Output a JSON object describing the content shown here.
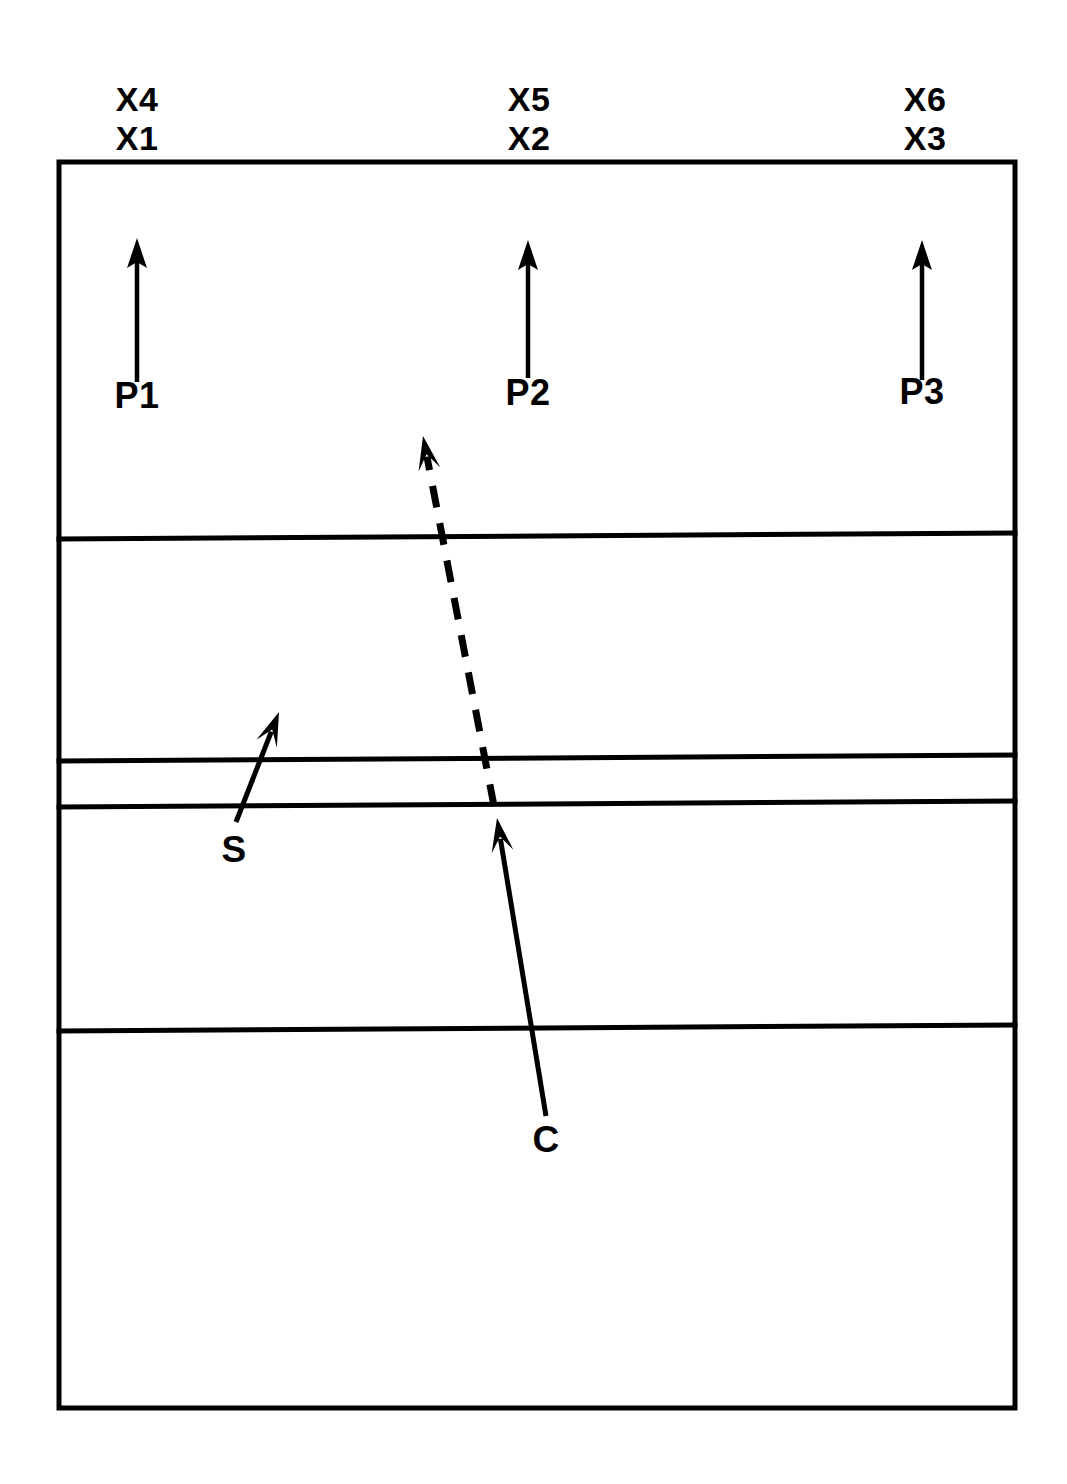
{
  "figure": {
    "type": "geologic-cross-section",
    "background_color": "#ffffff",
    "line_color": "#000000",
    "frame": {
      "left": 59,
      "top": 162,
      "right": 1015,
      "bottom": 1408
    }
  },
  "horizon_labels": [
    {
      "id": "left",
      "top_label": "X4",
      "bottom_label": "X1",
      "x": 137
    },
    {
      "id": "center",
      "top_label": "X5",
      "bottom_label": "X2",
      "x": 529
    },
    {
      "id": "right",
      "top_label": "X6",
      "bottom_label": "X3",
      "x": 925
    }
  ],
  "marker_arrows": [
    {
      "label": "P1",
      "x": 137,
      "tip_y": 238,
      "tail_y": 382,
      "label_y": 408
    },
    {
      "label": "P2",
      "x": 528,
      "tip_y": 240,
      "tail_y": 378,
      "label_y": 405
    },
    {
      "label": "P3",
      "x": 922,
      "tip_y": 240,
      "tail_y": 380,
      "label_y": 404
    }
  ],
  "feature_arrows": [
    {
      "label": "S",
      "style": "solid",
      "tail_x": 236,
      "tail_y": 822,
      "tip_x": 279,
      "tip_y": 712,
      "label_x": 234,
      "label_y": 862
    },
    {
      "label": "C",
      "style": "solid",
      "tail_x": 546,
      "tail_y": 1116,
      "tip_x": 497,
      "tip_y": 818,
      "label_x": 546,
      "label_y": 1152
    },
    {
      "label": "",
      "style": "dashed",
      "tail_x": 494,
      "tail_y": 806,
      "tip_x": 423,
      "tip_y": 436,
      "label_x": 0,
      "label_y": 0
    }
  ],
  "strata_lines": [
    {
      "id": "horizon-1",
      "left_y": 539,
      "right_y": 533
    },
    {
      "id": "horizon-2",
      "left_y": 761,
      "right_y": 755
    },
    {
      "id": "horizon-3",
      "left_y": 807,
      "right_y": 801
    },
    {
      "id": "horizon-4",
      "left_y": 1031,
      "right_y": 1025
    }
  ],
  "chart_data": {
    "type": "diagram",
    "title": "",
    "layers": [
      {
        "name": "layer-1",
        "top_y": 162,
        "bottom_y": 539
      },
      {
        "name": "layer-2",
        "top_y": 539,
        "bottom_y": 761
      },
      {
        "name": "layer-3",
        "top_y": 761,
        "bottom_y": 807
      },
      {
        "name": "layer-4",
        "top_y": 807,
        "bottom_y": 1031
      },
      {
        "name": "layer-5",
        "top_y": 1031,
        "bottom_y": 1408
      }
    ],
    "labels": [
      "X4",
      "X1",
      "X5",
      "X2",
      "X6",
      "X3",
      "P1",
      "P2",
      "P3",
      "S",
      "C"
    ]
  }
}
